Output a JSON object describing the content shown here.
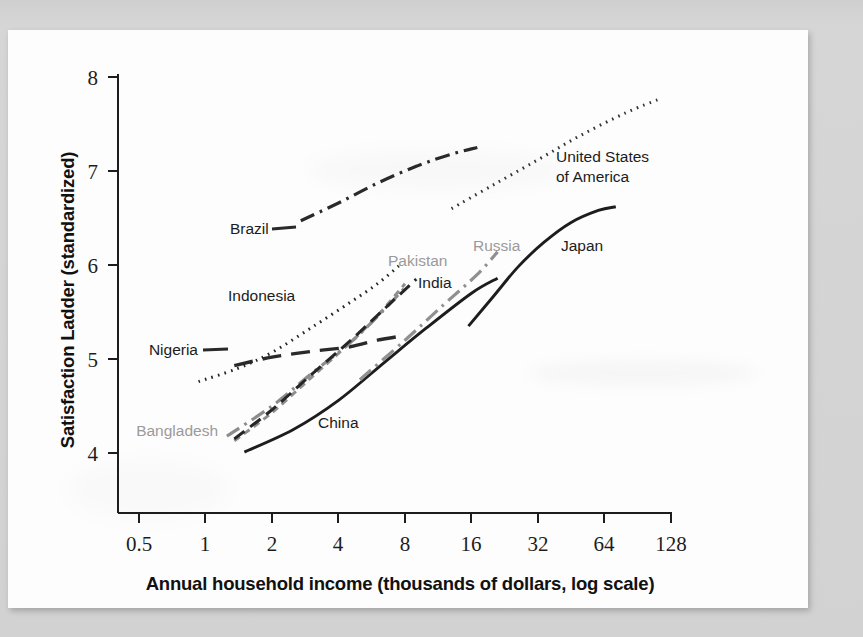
{
  "figure": {
    "kind": "scanned-line-chart",
    "paper_color": "#fdfdfd",
    "background_color": "#d4d4d4"
  },
  "axes": {
    "y_title": "Satisfaction Ladder (standardized)",
    "x_title": "Annual household income (thousands of dollars, log scale)",
    "y_ticks": [
      "8",
      "7",
      "6",
      "5",
      "4"
    ],
    "x_ticks": [
      "0.5",
      "1",
      "2",
      "4",
      "8",
      "16",
      "32",
      "64",
      "128"
    ]
  },
  "labels": {
    "nigeria": "Nigeria",
    "bangladesh": "Bangladesh",
    "china": "China",
    "indonesia": "Indonesia",
    "pakistan": "Pakistan",
    "india": "India",
    "russia": "Russia",
    "japan": "Japan",
    "brazil": "Brazil",
    "usa_line1": "United States",
    "usa_line2": "of America"
  },
  "chart_data": {
    "type": "line",
    "title": "",
    "xlabel": "Annual household income (thousands of dollars, log scale)",
    "ylabel": "Satisfaction Ladder (standardized)",
    "x_scale": "log2",
    "xlim": [
      0.5,
      128
    ],
    "ylim": [
      3.55,
      8.1
    ],
    "x_tick_values": [
      0.5,
      1,
      2,
      4,
      8,
      16,
      32,
      64,
      128
    ],
    "y_tick_values": [
      4,
      5,
      6,
      7,
      8
    ],
    "grid": false,
    "legend": "inline-labels",
    "series": [
      {
        "name": "Nigeria",
        "style": "long-dash",
        "color": "#2a2a2a",
        "label_color": "#1c1c1c",
        "points": [
          {
            "x": 1.35,
            "y": 4.93
          },
          {
            "x": 2.0,
            "y": 5.02
          },
          {
            "x": 3.0,
            "y": 5.08
          },
          {
            "x": 4.5,
            "y": 5.13
          },
          {
            "x": 6.0,
            "y": 5.2
          },
          {
            "x": 8.0,
            "y": 5.25
          }
        ]
      },
      {
        "name": "Bangladesh",
        "style": "dash-dot",
        "color": "#8c8c8c",
        "label_color": "#9a9a9a",
        "points": [
          {
            "x": 1.25,
            "y": 4.18
          },
          {
            "x": 2.0,
            "y": 4.5
          },
          {
            "x": 3.0,
            "y": 4.84
          },
          {
            "x": 4.5,
            "y": 5.17
          },
          {
            "x": 6.0,
            "y": 5.45
          },
          {
            "x": 8.0,
            "y": 5.76
          }
        ]
      },
      {
        "name": "China",
        "style": "solid",
        "color": "#1d1d1d",
        "label_color": "#1c1c1c",
        "points": [
          {
            "x": 1.5,
            "y": 4.01
          },
          {
            "x": 2.5,
            "y": 4.25
          },
          {
            "x": 4.0,
            "y": 4.56
          },
          {
            "x": 6.5,
            "y": 4.97
          },
          {
            "x": 10.0,
            "y": 5.33
          },
          {
            "x": 16.0,
            "y": 5.7
          },
          {
            "x": 21.0,
            "y": 5.86
          }
        ]
      },
      {
        "name": "Indonesia",
        "style": "dotted",
        "color": "#242424",
        "label_color": "#1c1c1c",
        "points": [
          {
            "x": 0.93,
            "y": 4.76
          },
          {
            "x": 1.4,
            "y": 4.9
          },
          {
            "x": 2.0,
            "y": 5.07
          },
          {
            "x": 3.0,
            "y": 5.33
          },
          {
            "x": 4.5,
            "y": 5.6
          },
          {
            "x": 6.0,
            "y": 5.8
          },
          {
            "x": 7.5,
            "y": 5.99
          }
        ]
      },
      {
        "name": "Pakistan",
        "style": "short-dash",
        "color": "#8e8e8e",
        "label_color": "#9a9a9a",
        "points": [
          {
            "x": 1.35,
            "y": 4.13
          },
          {
            "x": 2.0,
            "y": 4.43
          },
          {
            "x": 3.0,
            "y": 4.8
          },
          {
            "x": 4.5,
            "y": 5.17
          },
          {
            "x": 6.0,
            "y": 5.46
          },
          {
            "x": 8.0,
            "y": 5.8
          }
        ]
      },
      {
        "name": "India",
        "style": "dash",
        "color": "#262626",
        "label_color": "#1c1c1c",
        "points": [
          {
            "x": 1.35,
            "y": 4.15
          },
          {
            "x": 2.0,
            "y": 4.46
          },
          {
            "x": 3.0,
            "y": 4.83
          },
          {
            "x": 4.5,
            "y": 5.19
          },
          {
            "x": 6.5,
            "y": 5.54
          },
          {
            "x": 9.0,
            "y": 5.85
          }
        ]
      },
      {
        "name": "Russia",
        "style": "dash-dot",
        "color": "#909090",
        "label_color": "#9a9a9a",
        "points": [
          {
            "x": 5.0,
            "y": 4.78
          },
          {
            "x": 8.0,
            "y": 5.2
          },
          {
            "x": 12.0,
            "y": 5.58
          },
          {
            "x": 17.0,
            "y": 5.9
          },
          {
            "x": 21.0,
            "y": 6.14
          }
        ]
      },
      {
        "name": "Japan",
        "style": "solid",
        "color": "#1d1d1d",
        "label_color": "#1c1c1c",
        "points": [
          {
            "x": 15.5,
            "y": 5.35
          },
          {
            "x": 20.0,
            "y": 5.66
          },
          {
            "x": 26.0,
            "y": 5.98
          },
          {
            "x": 34.0,
            "y": 6.24
          },
          {
            "x": 45.0,
            "y": 6.45
          },
          {
            "x": 60.0,
            "y": 6.58
          },
          {
            "x": 72.0,
            "y": 6.62
          }
        ]
      },
      {
        "name": "Brazil",
        "style": "dash-dot",
        "color": "#2a2a2a",
        "label_color": "#1c1c1c",
        "points": [
          {
            "x": 2.7,
            "y": 6.47
          },
          {
            "x": 4.0,
            "y": 6.66
          },
          {
            "x": 6.0,
            "y": 6.87
          },
          {
            "x": 9.0,
            "y": 7.05
          },
          {
            "x": 13.0,
            "y": 7.18
          },
          {
            "x": 17.0,
            "y": 7.25
          }
        ]
      },
      {
        "name": "United States of America",
        "style": "dotted",
        "color": "#333333",
        "label_color": "#1c1c1c",
        "points": [
          {
            "x": 13.0,
            "y": 6.6
          },
          {
            "x": 20.0,
            "y": 6.85
          },
          {
            "x": 32.0,
            "y": 7.12
          },
          {
            "x": 50.0,
            "y": 7.38
          },
          {
            "x": 80.0,
            "y": 7.62
          },
          {
            "x": 112.0,
            "y": 7.76
          }
        ]
      }
    ]
  }
}
